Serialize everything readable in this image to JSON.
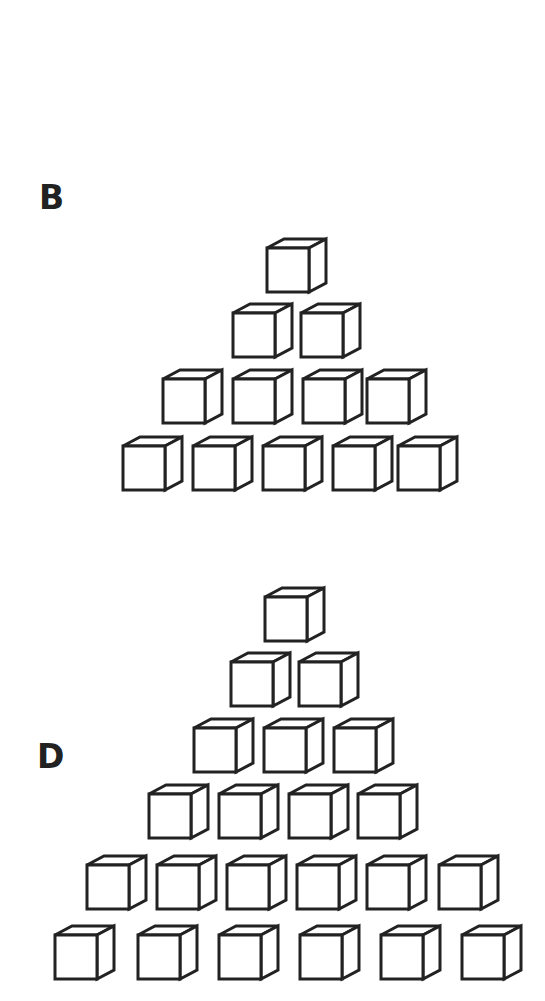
{
  "figures": [
    {
      "label": "B",
      "label_pos": [
        39,
        181
      ],
      "rows": [
        {
          "count": 1,
          "y": 248,
          "xs": [
            267
          ]
        },
        {
          "count": 2,
          "y": 313,
          "xs": [
            233,
            301
          ]
        },
        {
          "count": 4,
          "y": 379,
          "xs": [
            163,
            233,
            303,
            367
          ]
        },
        {
          "count": 5,
          "y": 446,
          "xs": [
            123,
            193,
            263,
            333,
            398
          ]
        }
      ],
      "total_cubes": 12
    },
    {
      "label": "D",
      "label_pos": [
        37,
        740
      ],
      "rows": [
        {
          "count": 1,
          "y": 597,
          "xs": [
            265
          ]
        },
        {
          "count": 2,
          "y": 662,
          "xs": [
            231,
            299
          ]
        },
        {
          "count": 3,
          "y": 728,
          "xs": [
            194,
            264,
            334
          ]
        },
        {
          "count": 4,
          "y": 794,
          "xs": [
            149,
            219,
            289,
            358
          ]
        },
        {
          "count": 6,
          "y": 865,
          "xs": [
            87,
            157,
            227,
            297,
            367,
            439
          ]
        },
        {
          "count": 6,
          "y": 935,
          "xs": [
            55,
            138,
            219,
            300,
            381,
            462
          ]
        }
      ],
      "total_cubes": 22
    }
  ],
  "cube_style": {
    "front_size": [
      42,
      44
    ],
    "depth_offset": [
      17,
      -9
    ],
    "stroke": "#222222",
    "stroke_width": 3,
    "fill": "#ffffff"
  }
}
